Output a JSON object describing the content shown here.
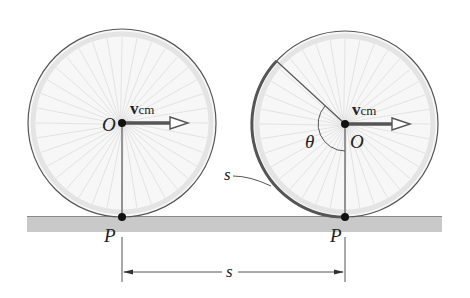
{
  "diagram": {
    "left_wheel": {
      "center_label": "O",
      "contact_label": "P",
      "velocity_label": "v",
      "velocity_subscript": "cm"
    },
    "right_wheel": {
      "center_label": "O",
      "contact_label": "P",
      "velocity_label": "v",
      "velocity_subscript": "cm",
      "angle_label": "θ",
      "arc_label": "s"
    },
    "distance_label": "s",
    "colors": {
      "wheel_fill": "#f6f6f6",
      "wheel_rim": "#e2e2e2",
      "wheel_edge": "#555555",
      "spokes": "#e0e0e0",
      "ground": "#c8c8c8",
      "ink": "#222222",
      "arrow": "#555555"
    }
  }
}
